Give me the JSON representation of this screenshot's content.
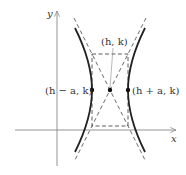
{
  "diagram": {
    "type": "hyperbola-horizontal-transverse-axis",
    "axes": {
      "x_label": "x",
      "y_label": "y"
    },
    "labels": {
      "center": "(h, k)",
      "left_vertex": "(h − a, k)",
      "right_vertex": "(h + a, k)"
    },
    "colors": {
      "curve": "#222222",
      "axis": "#888888",
      "dashed": "#333333",
      "text": "#333333"
    }
  }
}
